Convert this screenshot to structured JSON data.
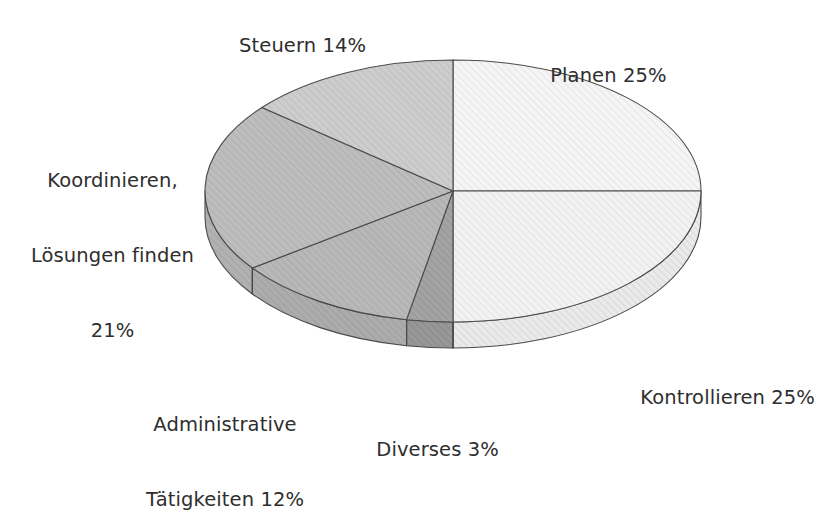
{
  "chart_data": {
    "type": "pie",
    "title": "",
    "subtitle": "",
    "xlabel": "",
    "ylabel": "",
    "three_d": true,
    "start_angle_deg": 0,
    "direction": "clockwise",
    "legend_position": "none",
    "labels_position": "outside",
    "value_unit": "%",
    "total": 100,
    "categories": [
      "Planen",
      "Kontrollieren",
      "Diverses",
      "Administrative Tätigkeiten",
      "Koordinieren, Lösungen finden",
      "Steuern"
    ],
    "values": [
      25,
      25,
      3,
      12,
      21,
      14
    ],
    "slices": [
      {
        "key": "planen",
        "name": "Planen",
        "value": 25,
        "value_text": "25%",
        "label": "Planen 25%",
        "fill": "#f3f3f3",
        "side_fill": "#e4e4e4",
        "hatch": "#dadada"
      },
      {
        "key": "kontrollieren",
        "name": "Kontrollieren",
        "value": 25,
        "value_text": "25%",
        "label": "Kontrollieren 25%",
        "fill": "#efefef",
        "side_fill": "#e0e0e0",
        "hatch": "#d6d6d6"
      },
      {
        "key": "diverses",
        "name": "Diverses",
        "value": 3,
        "value_text": "3%",
        "label": "Diverses 3%",
        "fill": "#9c9c9c",
        "side_fill": "#8d8d8d",
        "hatch": "#8a8a8a"
      },
      {
        "key": "administrative",
        "name": "Administrative Tätigkeiten",
        "value": 12,
        "value_text": "12%",
        "label_line1": "Administrative",
        "label_line2": "Tätigkeiten 12%",
        "fill": "#b4b4b4",
        "side_fill": "#a4a4a4",
        "hatch": "#a1a1a1"
      },
      {
        "key": "koordinieren",
        "name": "Koordinieren, Lösungen finden",
        "value": 21,
        "value_text": "21%",
        "label_line1": "Koordinieren,",
        "label_line2": "Lösungen finden",
        "label_line3": "21%",
        "fill": "#b9b9b9",
        "side_fill": "#a9a9a9",
        "hatch": "#a6a6a6"
      },
      {
        "key": "steuern",
        "name": "Steuern",
        "value": 14,
        "value_text": "14%",
        "label": "Steuern 14%",
        "fill": "#c9c9c9",
        "side_fill": "#bababa",
        "hatch": "#b6b6b6"
      }
    ],
    "colors": {
      "background": "#ffffff",
      "outline": "#4a4a4a",
      "label_text": "#2e2e2e"
    }
  }
}
